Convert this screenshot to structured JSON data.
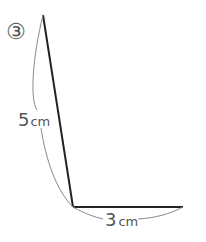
{
  "figure": {
    "number_label": "③",
    "side_long": {
      "value": "5",
      "unit": "cm"
    },
    "side_short": {
      "value": "3",
      "unit": "cm"
    },
    "colors": {
      "segment": "#222222",
      "arc": "#777777",
      "label": "#555555"
    }
  }
}
